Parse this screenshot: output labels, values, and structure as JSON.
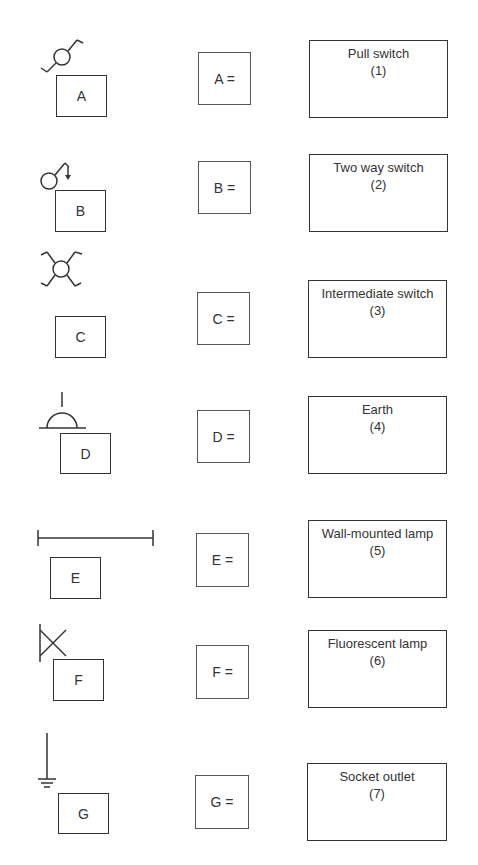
{
  "symbols": [
    {
      "letter": "A",
      "icon": "pull-switch-icon"
    },
    {
      "letter": "B",
      "icon": "two-way-switch-icon"
    },
    {
      "letter": "C",
      "icon": "intermediate-switch-icon"
    },
    {
      "letter": "D",
      "icon": "socket-outlet-icon"
    },
    {
      "letter": "E",
      "icon": "fluorescent-lamp-icon"
    },
    {
      "letter": "F",
      "icon": "wall-mounted-lamp-icon"
    },
    {
      "letter": "G",
      "icon": "earth-icon"
    }
  ],
  "answers": [
    {
      "label": "A ="
    },
    {
      "label": "B ="
    },
    {
      "label": "C ="
    },
    {
      "label": "D ="
    },
    {
      "label": "E ="
    },
    {
      "label": "F ="
    },
    {
      "label": "G ="
    }
  ],
  "names": [
    {
      "name": "Pull switch",
      "number": "(1)"
    },
    {
      "name": "Two way switch",
      "number": "(2)"
    },
    {
      "name": "Intermediate switch",
      "number": "(3)"
    },
    {
      "name": "Earth",
      "number": "(4)"
    },
    {
      "name": "Wall-mounted lamp",
      "number": "(5)"
    },
    {
      "name": "Fluorescent lamp",
      "number": "(6)"
    },
    {
      "name": "Socket outlet",
      "number": "(7)"
    }
  ],
  "colors": {
    "stroke": "#333333",
    "background": "#ffffff"
  }
}
